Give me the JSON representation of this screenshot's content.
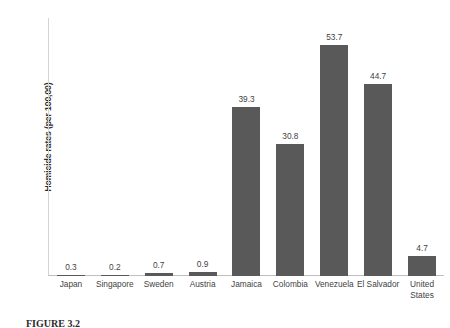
{
  "chart_data": {
    "type": "bar",
    "title": "",
    "xlabel": "",
    "ylabel": "Homicide rates (per 100,00)",
    "categories": [
      "Japan",
      "Singapore",
      "Sweden",
      "Austria",
      "Jamaica",
      "Colombia",
      "Venezuela",
      "El Salvador",
      "United States"
    ],
    "values": [
      0.3,
      0.2,
      0.7,
      0.9,
      39.3,
      30.8,
      53.7,
      44.7,
      4.7
    ],
    "value_labels": [
      "0.3",
      "0.2",
      "0.7",
      "0.9",
      "39.3",
      "30.8",
      "53.7",
      "44.7",
      "4.7"
    ],
    "ylim": [
      0,
      60
    ],
    "yticks": [
      0,
      10,
      20,
      30,
      40,
      50,
      60
    ],
    "ytick_labels": [
      "0",
      "10",
      "20",
      "30",
      "40",
      "50",
      "60"
    ],
    "grid": false,
    "legend": "none",
    "bar_color": "#595959",
    "axis_color": "#bfbfbf"
  },
  "caption": {
    "figure_number": "FIGURE 3.2",
    "text": ""
  }
}
